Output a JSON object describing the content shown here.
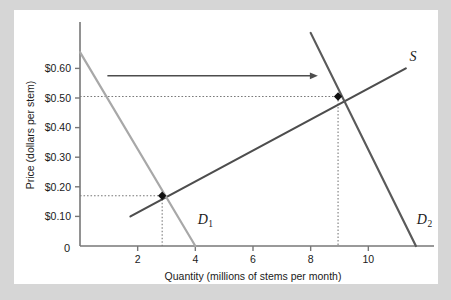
{
  "figure": {
    "background_color": "#d6d6d6",
    "plate_color": "#ffffff"
  },
  "chart_data": {
    "type": "line",
    "title": "",
    "xlabel": "Quantity (millions of stems per month)",
    "ylabel": "Price (dollars per stem)",
    "xlim": [
      0,
      12
    ],
    "ylim": [
      0,
      0.75
    ],
    "grid": false,
    "legend_position": "inline-curve-labels",
    "x_tick_values": [
      2,
      4,
      6,
      8,
      10
    ],
    "x_tick_labels": [
      "2",
      "4",
      "6",
      "8",
      "10"
    ],
    "y_tick_values": [
      0.1,
      0.2,
      0.3,
      0.4,
      0.5,
      0.6
    ],
    "y_tick_labels": [
      "$0.10",
      "$0.20",
      "$0.30",
      "$0.40",
      "$0.50",
      "$0.60"
    ],
    "origin_label": "0",
    "series": [
      {
        "name": "S",
        "label": "S",
        "role": "supply",
        "color": "#4d4d4d",
        "width": 2.2,
        "points": [
          [
            1.75,
            0.1
          ],
          [
            11.3,
            0.6
          ]
        ]
      },
      {
        "name": "D1",
        "label": "D",
        "label_sub": "1",
        "role": "demand-initial",
        "color": "#a8a8a8",
        "width": 2.2,
        "points": [
          [
            0.0,
            0.655
          ],
          [
            4.0,
            0.0
          ]
        ]
      },
      {
        "name": "D2",
        "label": "D",
        "label_sub": "2",
        "role": "demand-shifted",
        "color": "#5a5a5a",
        "width": 2.2,
        "points": [
          [
            8.0,
            0.72
          ],
          [
            11.65,
            0.0
          ]
        ]
      }
    ],
    "equilibria": [
      {
        "name": "initial-equilibrium",
        "x": 2.85,
        "y": 0.17,
        "marker": "filled-diamond",
        "color": "#111111"
      },
      {
        "name": "new-equilibrium",
        "x": 8.95,
        "y": 0.505,
        "marker": "filled-diamond",
        "color": "#111111"
      }
    ],
    "annotations": [
      {
        "type": "shift-arrow",
        "name": "demand-shift-arrow",
        "from": [
          0.95,
          0.575
        ],
        "to": [
          8.25,
          0.575
        ],
        "color": "#4d4d4d"
      }
    ],
    "curve_label_positions": {
      "S": [
        11.55,
        0.625
      ],
      "D1": [
        4.35,
        0.075
      ],
      "D2": [
        11.95,
        0.075
      ]
    },
    "dotted_guides": [
      {
        "name": "initial-price-guide",
        "from": [
          0,
          0.17
        ],
        "to": [
          2.85,
          0.17
        ]
      },
      {
        "name": "initial-quantity-guide",
        "from": [
          2.85,
          0.17
        ],
        "to": [
          2.85,
          0
        ]
      },
      {
        "name": "new-price-guide",
        "from": [
          0,
          0.505
        ],
        "to": [
          8.95,
          0.505
        ]
      },
      {
        "name": "new-quantity-guide",
        "from": [
          8.95,
          0.505
        ],
        "to": [
          8.95,
          0
        ]
      }
    ],
    "axis_color": "#777777",
    "guide_color": "#7a7a7a"
  }
}
